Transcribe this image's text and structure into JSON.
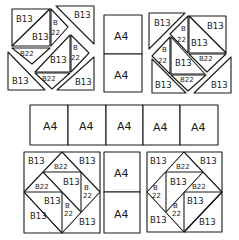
{
  "diagram": {
    "type": "quilt-assembly-layout",
    "labels": {
      "b13": "B13",
      "b22": "B22",
      "b": "B",
      "n22": "22",
      "a4": "A4"
    },
    "top_row": {
      "left_block": {
        "pieces": [
          "B13",
          "B13",
          "B22",
          "B22",
          "B13",
          "B13",
          "B13",
          "B22",
          "B22"
        ]
      },
      "center_column": {
        "cells": [
          "A4",
          "A4"
        ]
      },
      "right_block": {
        "pieces": [
          "B13",
          "B13",
          "B22",
          "B22",
          "B13",
          "B13",
          "B22",
          "B22",
          "B13",
          "B13"
        ]
      }
    },
    "middle_row": {
      "cells": [
        "A4",
        "A4",
        "A4",
        "A4",
        "A4"
      ]
    },
    "bottom_row": {
      "left_block": {
        "pieces": [
          "B13",
          "B22",
          "B13",
          "B22",
          "B13",
          "B22",
          "B13",
          "B13",
          "B13",
          "B22"
        ]
      },
      "center_column": {
        "cells": [
          "A4",
          "A4"
        ]
      },
      "right_block": {
        "pieces": [
          "B13",
          "B22",
          "B13",
          "B22",
          "B13",
          "B22",
          "B13",
          "B13",
          "B13",
          "B22"
        ]
      }
    }
  }
}
